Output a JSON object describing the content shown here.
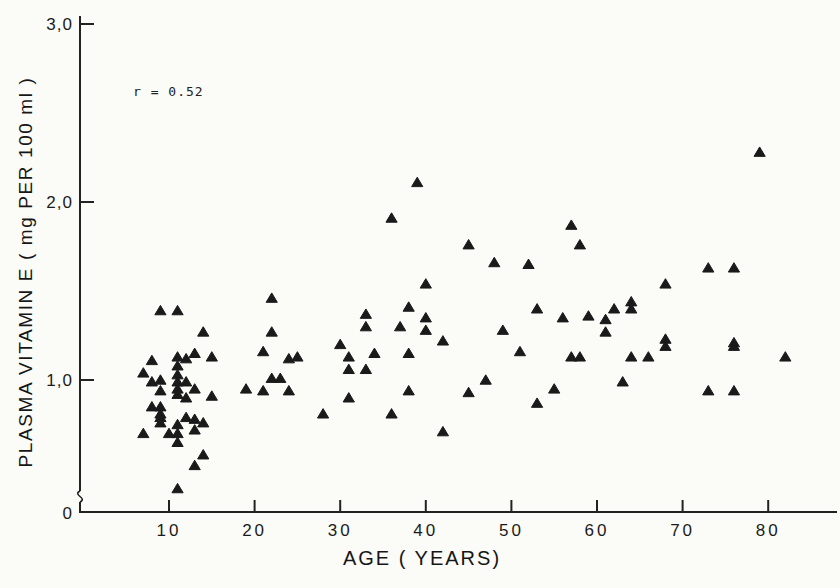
{
  "figure": {
    "annotation": "r = 0.52",
    "colors": {
      "background": "#fbfbf8",
      "marker": "#1a1a1a",
      "axis": "#222222",
      "text": "#1f1f1f"
    }
  },
  "chart_data": {
    "type": "scatter",
    "title": "",
    "xlabel": "AGE ( YEARS)",
    "ylabel": "PLASMA VITAMIN E  ( mg PER 100 ml )",
    "annotation": "r = 0.52",
    "marker": "filled-triangle-up",
    "grid": false,
    "legend": "none",
    "xlim": [
      0,
      88
    ],
    "ylim": [
      0,
      3.0
    ],
    "y_axis_break_near_zero": true,
    "x_ticks": [
      10,
      20,
      30,
      40,
      50,
      60,
      70,
      80
    ],
    "y_ticks": [
      {
        "value": 3.0,
        "label": "3,0"
      },
      {
        "value": 2.0,
        "label": "2,0"
      },
      {
        "value": 1.0,
        "label": "1,0"
      },
      {
        "value": 0,
        "label": "0"
      }
    ],
    "points": [
      [
        9,
        1.39
      ],
      [
        11,
        1.39
      ],
      [
        14,
        1.27
      ],
      [
        8,
        1.11
      ],
      [
        11,
        1.13
      ],
      [
        12,
        1.12
      ],
      [
        11,
        1.08
      ],
      [
        13,
        1.15
      ],
      [
        15,
        1.13
      ],
      [
        7,
        1.04
      ],
      [
        8,
        0.99
      ],
      [
        9,
        1.0
      ],
      [
        11,
        1.03
      ],
      [
        11,
        0.99
      ],
      [
        12,
        0.99
      ],
      [
        9,
        0.94
      ],
      [
        11,
        0.95
      ],
      [
        11,
        0.92
      ],
      [
        13,
        0.95
      ],
      [
        12,
        0.9
      ],
      [
        15,
        0.91
      ],
      [
        8,
        0.85
      ],
      [
        9,
        0.85
      ],
      [
        9,
        0.81
      ],
      [
        12,
        0.79
      ],
      [
        13,
        0.78
      ],
      [
        14,
        0.76
      ],
      [
        9,
        0.79
      ],
      [
        9,
        0.76
      ],
      [
        11,
        0.75
      ],
      [
        7,
        0.7
      ],
      [
        10,
        0.7
      ],
      [
        11,
        0.7
      ],
      [
        13,
        0.72
      ],
      [
        11,
        0.65
      ],
      [
        14,
        0.58
      ],
      [
        13,
        0.52
      ],
      [
        11,
        0.39
      ],
      [
        22,
        1.46
      ],
      [
        22,
        1.27
      ],
      [
        21,
        1.16
      ],
      [
        24,
        1.12
      ],
      [
        25,
        1.13
      ],
      [
        30,
        1.2
      ],
      [
        31,
        1.13
      ],
      [
        33,
        1.37
      ],
      [
        33,
        1.3
      ],
      [
        34,
        1.15
      ],
      [
        31,
        1.06
      ],
      [
        33,
        1.06
      ],
      [
        22,
        1.01
      ],
      [
        23,
        1.01
      ],
      [
        19,
        0.95
      ],
      [
        21,
        0.94
      ],
      [
        24,
        0.94
      ],
      [
        31,
        0.9
      ],
      [
        28,
        0.81
      ],
      [
        36,
        0.81
      ],
      [
        40,
        1.54
      ],
      [
        38,
        1.41
      ],
      [
        40,
        1.35
      ],
      [
        37,
        1.3
      ],
      [
        40,
        1.28
      ],
      [
        42,
        1.22
      ],
      [
        38,
        1.15
      ],
      [
        49,
        1.28
      ],
      [
        51,
        1.16
      ],
      [
        53,
        1.4
      ],
      [
        56,
        1.35
      ],
      [
        47,
        1.0
      ],
      [
        45,
        0.93
      ],
      [
        38,
        0.94
      ],
      [
        55,
        0.95
      ],
      [
        53,
        0.87
      ],
      [
        42,
        0.71
      ],
      [
        73,
        1.63
      ],
      [
        76,
        1.63
      ],
      [
        68,
        1.54
      ],
      [
        64,
        1.44
      ],
      [
        62,
        1.4
      ],
      [
        64,
        1.4
      ],
      [
        59,
        1.36
      ],
      [
        61,
        1.34
      ],
      [
        61,
        1.27
      ],
      [
        68,
        1.23
      ],
      [
        68,
        1.19
      ],
      [
        57,
        1.13
      ],
      [
        58,
        1.13
      ],
      [
        64,
        1.13
      ],
      [
        66,
        1.13
      ],
      [
        76,
        1.21
      ],
      [
        76,
        1.19
      ],
      [
        82,
        1.13
      ],
      [
        63,
        0.99
      ],
      [
        73,
        0.94
      ],
      [
        76,
        0.94
      ],
      [
        39,
        2.11
      ],
      [
        36,
        1.91
      ],
      [
        45,
        1.76
      ],
      [
        48,
        1.66
      ],
      [
        52,
        1.65
      ],
      [
        57,
        1.87
      ],
      [
        58,
        1.76
      ],
      [
        79,
        2.28
      ]
    ]
  }
}
